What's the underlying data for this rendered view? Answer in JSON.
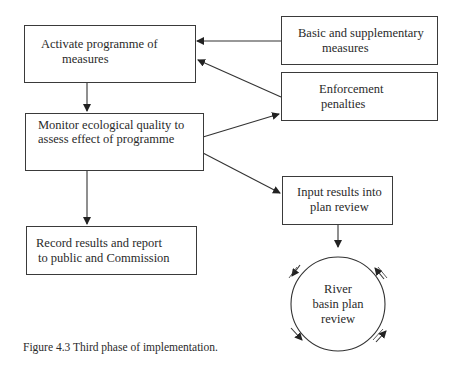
{
  "diagram": {
    "nodes": {
      "activate": {
        "line1": "Activate programme of",
        "line2": "measures"
      },
      "basic": {
        "line1": "Basic and supplementary",
        "line2": "measures"
      },
      "enforcement": {
        "line1": "Enforcement",
        "line2": "penalties"
      },
      "monitor": {
        "line1": "Monitor ecological quality to",
        "line2": "assess effect of programme"
      },
      "input": {
        "line1": "Input results into",
        "line2": "plan review"
      },
      "record": {
        "line1": "Record results and report",
        "line2": "to public and Commission"
      },
      "river": {
        "line1": "River",
        "line2": "basin plan",
        "line3": "review"
      }
    },
    "edges": [
      {
        "from": "basic",
        "to": "activate"
      },
      {
        "from": "enforcement",
        "to": "activate"
      },
      {
        "from": "activate",
        "to": "monitor"
      },
      {
        "from": "monitor",
        "to": "enforcement"
      },
      {
        "from": "monitor",
        "to": "input"
      },
      {
        "from": "monitor",
        "to": "record"
      },
      {
        "from": "input",
        "to": "river"
      }
    ],
    "caption": "Figure 4.3  Third phase of implementation."
  }
}
